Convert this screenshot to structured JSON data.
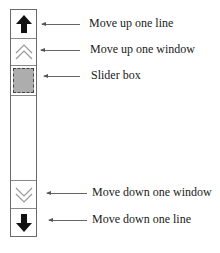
{
  "diagram": {
    "components": [
      {
        "id": "up_line",
        "icon": "solid-up-arrow-icon",
        "label": "Move up one line"
      },
      {
        "id": "up_window",
        "icon": "double-chevron-up-icon",
        "label": "Move up one window"
      },
      {
        "id": "slider",
        "icon": "stippled-slider-box",
        "label": "Slider box"
      },
      {
        "id": "down_window",
        "icon": "double-chevron-down-icon",
        "label": "Move down one window"
      },
      {
        "id": "down_line",
        "icon": "solid-down-arrow-icon",
        "label": "Move down one line"
      }
    ],
    "colors": {
      "arrow_fill": "#111111",
      "chevron_stroke": "#9a9a9a",
      "slider_fill": "#c8c8c8",
      "border": "#6a6a6a"
    }
  }
}
